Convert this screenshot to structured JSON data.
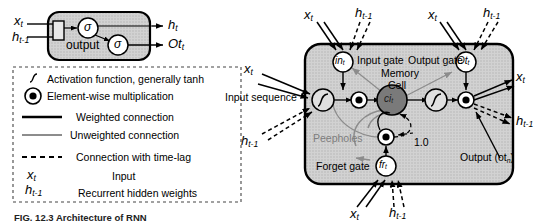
{
  "figure": {
    "caption": "FIG. 12.3 Architecture of RNN",
    "colors": {
      "block_fill": "#c9c9c9",
      "cell_fill": "#7a7a7a",
      "node_fill": "#ffffff",
      "stroke": "#000000",
      "peephole_gray": "#8c8c8c"
    }
  },
  "rnn_cell": {
    "name": "RNN cell",
    "inputs": [
      {
        "id": "x",
        "label": "x",
        "sub": "t"
      },
      {
        "id": "h_prev",
        "label": "h",
        "sub": "t-1"
      }
    ],
    "nodes": [
      {
        "id": "sigma1",
        "label": "σ"
      },
      {
        "id": "sigma2",
        "label": "σ"
      }
    ],
    "inner_label": "output",
    "outputs": [
      {
        "id": "h_t",
        "label": "h",
        "sub": "t"
      },
      {
        "id": "ot_t",
        "label": "Ot",
        "sub": "t"
      }
    ]
  },
  "legend": {
    "items": [
      {
        "icon": "tanh-curve-icon",
        "text": "Activation function, generally tanh"
      },
      {
        "icon": "element-wise-multiplication-icon",
        "text": "Element-wise multiplication"
      },
      {
        "icon": "weighted-connection-icon",
        "text": "Weighted connection"
      },
      {
        "icon": "unweighted-connection-icon",
        "text": "Unweighted connection"
      },
      {
        "icon": "time-lag-connection-icon",
        "text": "Connection with time-lag"
      }
    ],
    "symbols": [
      {
        "symbol": "x",
        "sub": "t",
        "text": "Input"
      },
      {
        "symbol": "h",
        "sub": "t-1",
        "text": "Recurrent hidden weights"
      }
    ]
  },
  "lstm": {
    "title": "LSTM memory block",
    "gates": [
      {
        "id": "input-gate",
        "node_label": "in",
        "node_sub": "t",
        "text": "Input gate"
      },
      {
        "id": "output-gate",
        "node_label": "Ot",
        "node_sub": "t",
        "text": "Output gate"
      },
      {
        "id": "forget-gate",
        "node_label": "fr",
        "node_sub": "t",
        "text": "Forget gate"
      }
    ],
    "memory_cell": {
      "line1": "Memory",
      "line2": "Cell",
      "node_label": "ci",
      "node_sub": "t"
    },
    "peepholes_label": "Peepholes",
    "carousel_weight": "1.0",
    "input_sequence_label": "Input sequence",
    "output_label": "Output (ot",
    "output_label_sub": "n",
    "output_label_tail": ")",
    "signals": {
      "x": {
        "label": "x",
        "sub": "t"
      },
      "h_prev": {
        "label": "h",
        "sub": "t-1"
      }
    }
  }
}
